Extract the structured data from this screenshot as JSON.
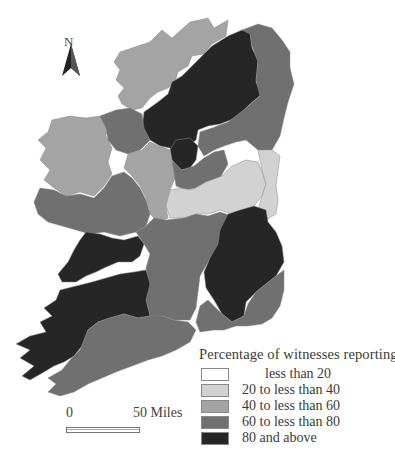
{
  "map": {
    "title": "Percentage of witnesses reporting",
    "north_label": "N",
    "scale": {
      "start": "0",
      "end": "50 Miles"
    },
    "colors": {
      "class_0_20": "#ffffff",
      "class_20_40": "#d2d2d2",
      "class_40_60": "#a4a4a4",
      "class_60_80": "#707070",
      "class_80_100": "#262626",
      "border": "#888888"
    }
  },
  "legend": {
    "title": "Percentage of witnesses reporting",
    "items": [
      {
        "label": "less than 20",
        "color": "#ffffff"
      },
      {
        "label": "20 to less than 40",
        "color": "#d2d2d2"
      },
      {
        "label": "40 to less than 60",
        "color": "#a4a4a4"
      },
      {
        "label": "60 to less than 80",
        "color": "#707070"
      },
      {
        "label": "80 and above",
        "color": "#262626"
      }
    ]
  }
}
